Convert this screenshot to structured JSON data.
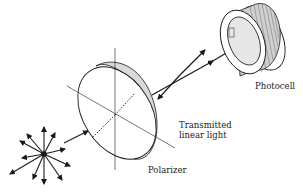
{
  "labels": {
    "photocell": "Photocell",
    "transmitted_line1": "Transmitted",
    "transmitted_line2": "linear  light",
    "polarizer": "Polarizer"
  },
  "colors": {
    "ink": "#1a1a1a",
    "rim_fill": "#d9d9d9",
    "lens_fill": "#e6e6e6",
    "background": "#ffffff"
  }
}
